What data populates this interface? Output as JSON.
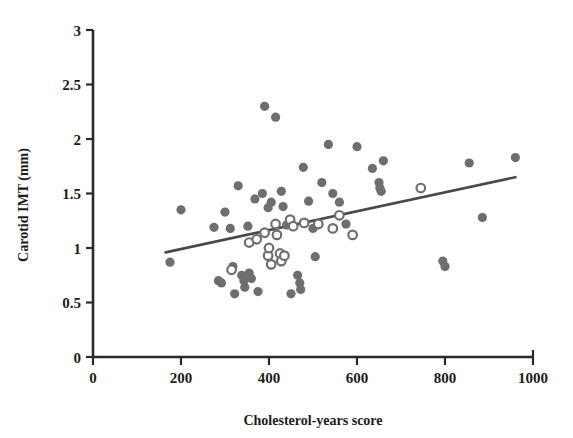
{
  "chart_data": {
    "type": "scatter",
    "title": "",
    "xlabel": "Cholesterol-years score",
    "ylabel": "Carotid IMT (mm)",
    "xlim": [
      0,
      1000
    ],
    "ylim": [
      0,
      3
    ],
    "xticks": [
      0,
      200,
      400,
      600,
      800,
      1000
    ],
    "yticks": [
      0,
      0.5,
      1,
      1.5,
      2,
      2.5,
      3
    ],
    "xtick_labels": [
      "0",
      "200",
      "400",
      "600",
      "800",
      "1000"
    ],
    "ytick_labels": [
      "0",
      "0.5",
      "1",
      "1.5",
      "2",
      "2.5",
      "3"
    ],
    "grid": false,
    "legend": "none",
    "marker_color": "#6e6e6e",
    "line_color": "#4a4a4a",
    "series": [
      {
        "name": "filled",
        "marker": "filled-circle",
        "points": [
          [
            175,
            0.87
          ],
          [
            200,
            1.35
          ],
          [
            275,
            1.19
          ],
          [
            285,
            0.7
          ],
          [
            292,
            0.68
          ],
          [
            300,
            1.33
          ],
          [
            312,
            1.18
          ],
          [
            318,
            0.83
          ],
          [
            322,
            0.58
          ],
          [
            330,
            1.57
          ],
          [
            338,
            0.75
          ],
          [
            343,
            0.7
          ],
          [
            345,
            0.64
          ],
          [
            352,
            1.2
          ],
          [
            355,
            0.77
          ],
          [
            360,
            0.72
          ],
          [
            368,
            1.45
          ],
          [
            375,
            0.6
          ],
          [
            385,
            1.5
          ],
          [
            390,
            2.3
          ],
          [
            398,
            1.37
          ],
          [
            405,
            1.42
          ],
          [
            415,
            2.2
          ],
          [
            428,
            1.52
          ],
          [
            432,
            1.38
          ],
          [
            440,
            1.21
          ],
          [
            450,
            0.58
          ],
          [
            465,
            0.75
          ],
          [
            470,
            0.68
          ],
          [
            472,
            0.62
          ],
          [
            478,
            1.74
          ],
          [
            490,
            1.43
          ],
          [
            500,
            1.18
          ],
          [
            505,
            0.92
          ],
          [
            520,
            1.6
          ],
          [
            535,
            1.95
          ],
          [
            545,
            1.5
          ],
          [
            560,
            1.42
          ],
          [
            575,
            1.22
          ],
          [
            600,
            1.93
          ],
          [
            635,
            1.73
          ],
          [
            650,
            1.6
          ],
          [
            652,
            1.55
          ],
          [
            655,
            1.52
          ],
          [
            660,
            1.8
          ],
          [
            795,
            0.88
          ],
          [
            800,
            0.83
          ],
          [
            855,
            1.78
          ],
          [
            885,
            1.28
          ],
          [
            960,
            1.83
          ]
        ]
      },
      {
        "name": "open",
        "marker": "open-circle",
        "points": [
          [
            315,
            0.8
          ],
          [
            355,
            1.05
          ],
          [
            372,
            1.08
          ],
          [
            390,
            1.14
          ],
          [
            398,
            0.93
          ],
          [
            400,
            1.0
          ],
          [
            405,
            0.85
          ],
          [
            415,
            1.22
          ],
          [
            418,
            1.12
          ],
          [
            425,
            0.95
          ],
          [
            428,
            0.88
          ],
          [
            435,
            0.93
          ],
          [
            448,
            1.26
          ],
          [
            455,
            1.2
          ],
          [
            480,
            1.23
          ],
          [
            512,
            1.22
          ],
          [
            545,
            1.18
          ],
          [
            560,
            1.3
          ],
          [
            590,
            1.12
          ],
          [
            745,
            1.55
          ]
        ]
      }
    ],
    "regression_line": {
      "x_start": 165,
      "y_start": 0.96,
      "x_end": 960,
      "y_end": 1.65
    }
  }
}
